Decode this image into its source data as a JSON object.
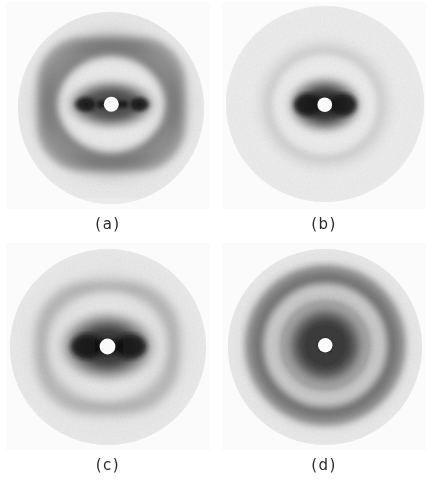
{
  "figure": {
    "type": "photographic-plate-grid",
    "columns": 2,
    "rows": 2,
    "background_color": "#ffffff",
    "plate_color": "#fbfbfb"
  },
  "panels": [
    {
      "id": "a",
      "caption": "(a)",
      "description": "X-ray diffraction photograph with strongly anisotropic, square-lobed pattern",
      "center_spot": "bright-white beam stop",
      "symmetry": "two-fold, horizontally elongated",
      "rings": [
        {
          "name": "beam-stop",
          "radius_pct": 4,
          "tone": "#ffffff"
        },
        {
          "name": "inner-dark-lobes",
          "radius_pct": 17,
          "tone": "#2e2e2e"
        },
        {
          "name": "inner-light-halo",
          "radius_pct": 28,
          "tone": "#e8e8e8"
        },
        {
          "name": "outer-dark-ring",
          "radius_pct": 42,
          "tone": "#6e6e6e"
        },
        {
          "name": "outer-light-field",
          "radius_pct": 62,
          "tone": "#e2e2e2"
        },
        {
          "name": "plate-edge-fog",
          "radius_pct": 100,
          "tone": "#efefef"
        }
      ]
    },
    {
      "id": "b",
      "caption": "(b)",
      "description": "X-ray diffraction photograph with compact dark core and single diffuse ring",
      "center_spot": "bright-white beam stop",
      "symmetry": "near circular, slight horizontal elongation",
      "rings": [
        {
          "name": "beam-stop",
          "radius_pct": 4,
          "tone": "#ffffff"
        },
        {
          "name": "dark-core",
          "radius_pct": 16,
          "tone": "#3a3a3a"
        },
        {
          "name": "light-halo",
          "radius_pct": 26,
          "tone": "#e4e4e4"
        },
        {
          "name": "outer-fringe",
          "radius_pct": 33,
          "tone": "#cfcfcf"
        },
        {
          "name": "outer-light-field",
          "radius_pct": 60,
          "tone": "#ededed"
        },
        {
          "name": "plate-edge-fog",
          "radius_pct": 100,
          "tone": "#f2f2f2"
        }
      ]
    },
    {
      "id": "c",
      "caption": "(c)",
      "description": "X-ray diffraction photograph with broad dark core and faint outer ring",
      "center_spot": "bright-white beam stop",
      "symmetry": "two-fold, moderately elongated",
      "rings": [
        {
          "name": "beam-stop",
          "radius_pct": 4,
          "tone": "#ffffff"
        },
        {
          "name": "dark-core",
          "radius_pct": 20,
          "tone": "#3c3c3c"
        },
        {
          "name": "light-halo",
          "radius_pct": 31,
          "tone": "#e0e0e0"
        },
        {
          "name": "outer-dark-ring",
          "radius_pct": 40,
          "tone": "#989898"
        },
        {
          "name": "outer-light-field",
          "radius_pct": 62,
          "tone": "#e9e9e9"
        },
        {
          "name": "plate-edge-fog",
          "radius_pct": 100,
          "tone": "#f1f1f1"
        }
      ]
    },
    {
      "id": "d",
      "caption": "(d)",
      "description": "X-ray diffraction photograph with well-resolved concentric circular rings",
      "center_spot": "bright-white beam stop",
      "symmetry": "circular (isotropic powder-like)",
      "rings": [
        {
          "name": "beam-stop",
          "radius_pct": 3,
          "tone": "#ffffff"
        },
        {
          "name": "dark-core",
          "radius_pct": 19,
          "tone": "#343434"
        },
        {
          "name": "bright-ring",
          "radius_pct": 29,
          "tone": "#dedede"
        },
        {
          "name": "second-dark-ring",
          "radius_pct": 41,
          "tone": "#5e5e5e"
        },
        {
          "name": "outer-light-field",
          "radius_pct": 62,
          "tone": "#e7e7e7"
        },
        {
          "name": "plate-edge-fog",
          "radius_pct": 100,
          "tone": "#f0f0f0"
        }
      ]
    }
  ]
}
